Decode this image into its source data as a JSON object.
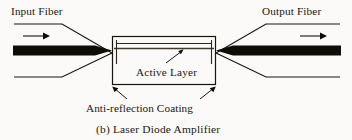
{
  "figure": {
    "caption": "(b)  Laser Diode Amplifier",
    "caption_index": "(b)",
    "caption_title": "Laser Diode Amplifier",
    "background_color": "#fbfaf8",
    "ink_color": "#17140f"
  },
  "labels": {
    "input_fiber": "Input Fiber",
    "output_fiber": "Output Fiber",
    "active_layer": "Active Layer",
    "anti_reflection_coating": "Anti-reflection Coating"
  },
  "components": {
    "input_fiber": {
      "name": "Input Fiber",
      "core_label": "fiber-core",
      "cladding_label": "fiber-cladding",
      "propagation_arrow": "right-arrow"
    },
    "output_fiber": {
      "name": "Output Fiber",
      "core_label": "fiber-core",
      "cladding_label": "fiber-cladding",
      "propagation_arrow": "right-arrow"
    },
    "amplifier_chip": {
      "name": "Laser Diode Amplifier",
      "active_layer": "Active Layer",
      "facet_coating": "Anti-reflection Coating",
      "facets": 2
    }
  },
  "annotations": [
    {
      "text": "Active Layer",
      "points_to": "active-layer-line",
      "leader": "diagonal-up-right"
    },
    {
      "text": "Anti-reflection Coating",
      "points_to": "chip-facets",
      "leader": "two-diagonal-arrows"
    }
  ]
}
